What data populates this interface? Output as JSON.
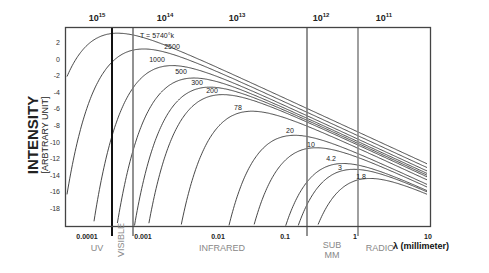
{
  "chart_data": {
    "type": "line",
    "title": "",
    "ylabel": "INTENSITY",
    "ylabel_sub": "[ARBTRARY UNIT]",
    "xlabel": "λ (millimeter)",
    "xscale": "log",
    "xlim": [
      0.0001,
      10
    ],
    "ylim": [
      -19.5,
      4
    ],
    "grid": false,
    "y_ticks": [
      "2",
      "0",
      "-2",
      "-4",
      "-6",
      "-8",
      "-10",
      "-12",
      "-14",
      "-16",
      "-18"
    ],
    "x_ticks": [
      "0.0001",
      "0.001",
      "0.01",
      "0.1",
      "1",
      "10"
    ],
    "top_axis_label": "frequency (Hz)",
    "top_ticks": [
      "10^15",
      "10^14",
      "10^13",
      "10^12",
      "10^11"
    ],
    "bands": [
      {
        "name": "UV",
        "range_mm": [
          0.0001,
          0.0004
        ]
      },
      {
        "name": "VISIBLE",
        "range_mm": [
          0.0004,
          0.0007
        ]
      },
      {
        "name": "INFRARED",
        "range_mm": [
          0.0007,
          0.35
        ]
      },
      {
        "name": "SUB MM",
        "range_mm": [
          0.35,
          1
        ]
      },
      {
        "name": "RADIO",
        "range_mm": [
          1,
          10
        ]
      }
    ],
    "series": [
      {
        "name": "T = 5740°k",
        "temperature_K": 5740,
        "peak_intensity": 3.3,
        "peak_lambda_mm": 0.0005
      },
      {
        "name": "2500",
        "temperature_K": 2500,
        "peak_intensity": 1.4,
        "peak_lambda_mm": 0.0012
      },
      {
        "name": "1000",
        "temperature_K": 1000,
        "peak_intensity": -0.6,
        "peak_lambda_mm": 0.0029
      },
      {
        "name": "500",
        "temperature_K": 500,
        "peak_intensity": -2.1,
        "peak_lambda_mm": 0.0058
      },
      {
        "name": "300",
        "temperature_K": 300,
        "peak_intensity": -3.2,
        "peak_lambda_mm": 0.0097
      },
      {
        "name": "200",
        "temperature_K": 200,
        "peak_intensity": -4.1,
        "peak_lambda_mm": 0.0145
      },
      {
        "name": "78",
        "temperature_K": 78,
        "peak_intensity": -6.1,
        "peak_lambda_mm": 0.037
      },
      {
        "name": "20",
        "temperature_K": 20,
        "peak_intensity": -9.0,
        "peak_lambda_mm": 0.145
      },
      {
        "name": "10",
        "temperature_K": 10,
        "peak_intensity": -10.5,
        "peak_lambda_mm": 0.29
      },
      {
        "name": "4.2",
        "temperature_K": 4.2,
        "peak_intensity": -12.4,
        "peak_lambda_mm": 0.69
      },
      {
        "name": "3",
        "temperature_K": 3,
        "peak_intensity": -13.1,
        "peak_lambda_mm": 0.97
      },
      {
        "name": "1.8",
        "temperature_K": 1.8,
        "peak_intensity": -14.2,
        "peak_lambda_mm": 1.6
      }
    ],
    "vertical_lines_mm": [
      0.0004,
      0.0007,
      0.35,
      1.0
    ]
  },
  "axes": {
    "y_title": "INTENSITY",
    "y_subtitle": "[ARBTRARY UNIT]",
    "x_title": "λ (millimeter)",
    "x_ticks": [
      {
        "label": "0.0001",
        "x": 87
      },
      {
        "label": "0.001",
        "x": 143
      },
      {
        "label": "0.01",
        "x": 218
      },
      {
        "label": "0.1",
        "x": 285
      },
      {
        "label": "1",
        "x": 355
      },
      {
        "label": "10",
        "x": 428
      }
    ],
    "y_ticks": [
      {
        "label": "2",
        "value": 2
      },
      {
        "label": "0",
        "value": 0
      },
      {
        "label": "-2",
        "value": -2
      },
      {
        "label": "-4",
        "value": -4
      },
      {
        "label": "-6",
        "value": -6
      },
      {
        "label": "-8",
        "value": -8
      },
      {
        "label": "-10",
        "value": -10
      },
      {
        "label": "-12",
        "value": -12
      },
      {
        "label": "-14",
        "value": -14
      },
      {
        "label": "-16",
        "value": -16
      },
      {
        "label": "-18",
        "value": -18
      }
    ],
    "top_ticks": [
      {
        "base": "10",
        "exp": "15",
        "x": 97
      },
      {
        "base": "10",
        "exp": "14",
        "x": 165
      },
      {
        "base": "10",
        "exp": "13",
        "x": 237
      },
      {
        "base": "10",
        "exp": "12",
        "x": 321
      },
      {
        "base": "10",
        "exp": "11",
        "x": 384
      }
    ]
  },
  "bands": [
    {
      "label": "UV",
      "x": 97,
      "y": 243
    },
    {
      "label": "INFRARED",
      "x": 222,
      "y": 243
    },
    {
      "label": "SUB",
      "x": 332,
      "y": 240
    },
    {
      "label": "MM",
      "x": 332,
      "y": 250
    },
    {
      "label": "RADIO",
      "x": 380,
      "y": 243
    }
  ],
  "visible_label": "VISIBLE",
  "curve_labels": [
    {
      "text": "T = 5740°k",
      "x": 157,
      "y": 38
    },
    {
      "text": "2500",
      "x": 172,
      "y": 49
    },
    {
      "text": "1000",
      "x": 157,
      "y": 62
    },
    {
      "text": "500",
      "x": 181,
      "y": 74
    },
    {
      "text": "300",
      "x": 197,
      "y": 85
    },
    {
      "text": "200",
      "x": 212,
      "y": 93
    },
    {
      "text": "78",
      "x": 238,
      "y": 110
    },
    {
      "text": "20",
      "x": 290,
      "y": 133
    },
    {
      "text": "10",
      "x": 311,
      "y": 147
    },
    {
      "text": "4.2",
      "x": 331,
      "y": 161
    },
    {
      "text": "3",
      "x": 340,
      "y": 170
    },
    {
      "text": "1.8",
      "x": 361,
      "y": 179
    }
  ]
}
